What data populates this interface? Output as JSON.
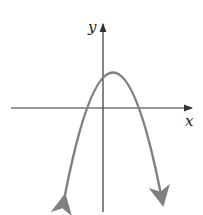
{
  "figure": {
    "type": "parabola graph, opening downward",
    "x_axis_label": "x",
    "y_axis_label": "y",
    "curve_color": "#808080",
    "axis_color": "#333333"
  }
}
